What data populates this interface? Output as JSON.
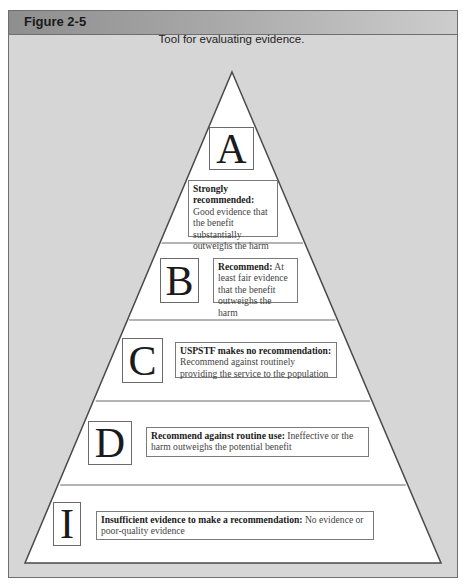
{
  "figure": {
    "label": "Figure 2-5",
    "caption": "Tool for evaluating evidence."
  },
  "pyramid": {
    "levels": [
      {
        "grade": "A",
        "title": "Strongly recommended:",
        "description": "Good evidence that the benefit substantially outweighs the harm"
      },
      {
        "grade": "B",
        "title": "Recommend:",
        "description": "At least fair evidence that the benefit outweighs the harm"
      },
      {
        "grade": "C",
        "title": "USPSTF makes no recommendation:",
        "description": "Recommend against routinely providing the service to the population"
      },
      {
        "grade": "D",
        "title": "Recommend against routine use:",
        "description": "Ineffective or the harm outweighs the potential benefit"
      },
      {
        "grade": "I",
        "title": "Insufficient evidence to make a recommendation:",
        "description": "No evidence or poor-quality evidence"
      }
    ]
  },
  "colors": {
    "panel_background": "#d6d6d6",
    "header_dark": "#8e8e8e",
    "pyramid_fill": "#ffffff",
    "outline": "#5a5a5a"
  }
}
